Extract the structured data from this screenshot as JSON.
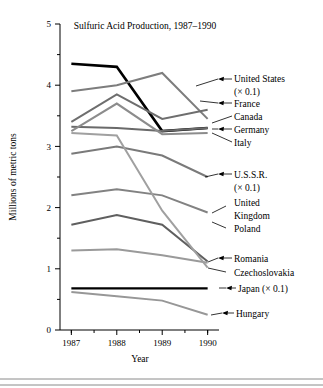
{
  "chart_data": {
    "type": "line",
    "title": "Sulfuric Acid Production, 1987–1990",
    "xlabel": "Year",
    "ylabel": "Millions of metric tons",
    "x": [
      1987,
      1988,
      1989,
      1990
    ],
    "xtick_labels": [
      "1987",
      "1988",
      "1989",
      "1990"
    ],
    "ytick_labels": [
      "0",
      "1",
      "2",
      "3",
      "4",
      "5"
    ],
    "xlim": [
      1986.75,
      1990.25
    ],
    "ylim": [
      0,
      5
    ],
    "grid": false,
    "legend_position": "right-inline-labels",
    "minor_ticks": true,
    "series": [
      {
        "name": "United States (× 0.1)",
        "label": "United States",
        "label_sub": "(× 0.1)",
        "color": "#000000",
        "width": 2.6,
        "values": [
          4.35,
          4.3,
          3.25,
          3.3
        ]
      },
      {
        "name": "France",
        "label": "France",
        "label_sub": "",
        "color": "#7d7d7d",
        "width": 2.0,
        "values": [
          3.9,
          4.0,
          4.2,
          3.45
        ]
      },
      {
        "name": "Canada",
        "label": "Canada",
        "label_sub": "",
        "color": "#6e6e6e",
        "width": 2.0,
        "values": [
          3.4,
          3.85,
          3.45,
          3.6
        ]
      },
      {
        "name": "Germany",
        "label": "Germany",
        "label_sub": "",
        "color": "#6a6a6a",
        "width": 2.0,
        "values": [
          3.32,
          3.3,
          3.25,
          3.3
        ]
      },
      {
        "name": "Italy",
        "label": "Italy",
        "label_sub": "",
        "color": "#8c8c8c",
        "width": 2.0,
        "values": [
          3.25,
          3.7,
          3.2,
          3.22
        ]
      },
      {
        "name": "U.S.S.R. (× 0.1)",
        "label": "U.S.S.R.",
        "label_sub": "(× 0.1)",
        "color": "#7a7a7a",
        "width": 2.0,
        "values": [
          2.88,
          3.0,
          2.85,
          2.5
        ]
      },
      {
        "name": "United Kingdom",
        "label_line1": "United",
        "label_line2": "Kingdom",
        "label": "United Kingdom",
        "label_sub": "",
        "color": "#828282",
        "width": 2.0,
        "values": [
          2.2,
          2.3,
          2.2,
          1.92
        ]
      },
      {
        "name": "Poland",
        "label": "Poland",
        "label_sub": "",
        "color": "#5f5f5f",
        "width": 2.0,
        "values": [
          1.72,
          1.88,
          1.72,
          1.12
        ]
      },
      {
        "name": "Romania",
        "label": "Romania",
        "label_sub": "",
        "color": "#9a9a9a",
        "width": 2.0,
        "values": [
          1.3,
          1.32,
          1.22,
          1.1
        ]
      },
      {
        "name": "Czechoslovakia",
        "label": "Czechoslovakia",
        "label_sub": "",
        "color": "#a0a0a0",
        "width": 2.0,
        "values": [
          3.22,
          3.18,
          1.95,
          1.02
        ]
      },
      {
        "name": "Japan (× 0.1)",
        "label": "Japan (× 0.1)",
        "label_sub": "",
        "color": "#000000",
        "width": 2.4,
        "values": [
          0.68,
          0.68,
          0.68,
          0.68
        ]
      },
      {
        "name": "Hungary",
        "label": "Hungary",
        "label_sub": "",
        "color": "#979797",
        "width": 2.0,
        "values": [
          0.62,
          0.55,
          0.48,
          0.25
        ]
      }
    ]
  },
  "labels": {
    "united_states": "United States",
    "united_states_sub": "(× 0.1)",
    "france": "France",
    "canada": "Canada",
    "germany": "Germany",
    "italy": "Italy",
    "ussr": "U.S.S.R.",
    "ussr_sub": "(× 0.1)",
    "uk_line1": "United",
    "uk_line2": "Kingdom",
    "poland": "Poland",
    "romania": "Romania",
    "czechoslovakia": "Czechoslovakia",
    "japan": "Japan (× 0.1)",
    "hungary": "Hungary"
  },
  "axis": {
    "y_label": "Millions of metric tons",
    "x_label": "Year",
    "y_ticks": [
      "5",
      "4",
      "3",
      "2",
      "1",
      "0"
    ],
    "x_ticks": [
      "1987",
      "1988",
      "1989",
      "1990"
    ]
  }
}
